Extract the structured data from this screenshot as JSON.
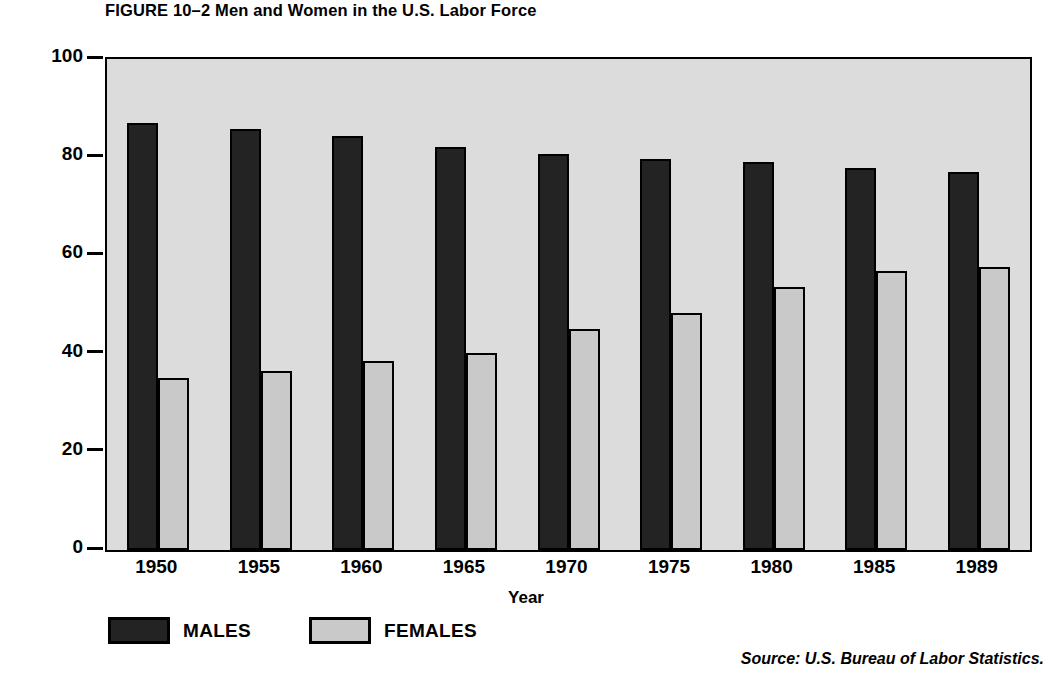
{
  "figure": {
    "title": "FIGURE 10–2 Men and Women in the U.S. Labor Force",
    "source": "Source: U.S. Bureau of Labor Statistics."
  },
  "legend": {
    "items": [
      {
        "label": "MALES",
        "color": "#232323",
        "series": "males"
      },
      {
        "label": "FEMALES",
        "color": "#c9c9c9",
        "series": "females"
      }
    ]
  },
  "colors": {
    "male_bar": "#232323",
    "female_bar": "#c9c9c9",
    "plot_background": "#dcdcdc",
    "axis": "#000000"
  },
  "chart_data": {
    "type": "bar",
    "title": "FIGURE 10–2 Men and Women in the U.S. Labor Force",
    "xlabel": "Year",
    "ylabel": "Percent in the labor force",
    "categories": [
      "1950",
      "1955",
      "1960",
      "1965",
      "1970",
      "1975",
      "1980",
      "1985",
      "1989"
    ],
    "series": [
      {
        "name": "MALES",
        "color": "#232323",
        "values": [
          87.0,
          85.8,
          84.3,
          82.1,
          80.7,
          79.6,
          79.1,
          77.9,
          77.0
        ]
      },
      {
        "name": "FEMALES",
        "color": "#c9c9c9",
        "values": [
          35.0,
          36.5,
          38.5,
          40.2,
          45.0,
          48.2,
          53.5,
          56.8,
          57.6
        ]
      }
    ],
    "ylim": [
      0,
      100
    ],
    "yticks": [
      0,
      20,
      40,
      60,
      80,
      100
    ],
    "ytick_labels": [
      "0",
      "20",
      "40",
      "60",
      "80",
      "100"
    ],
    "grid": false,
    "legend_position": "below-left",
    "bar_style": "grouped-adjacent-outlined"
  }
}
